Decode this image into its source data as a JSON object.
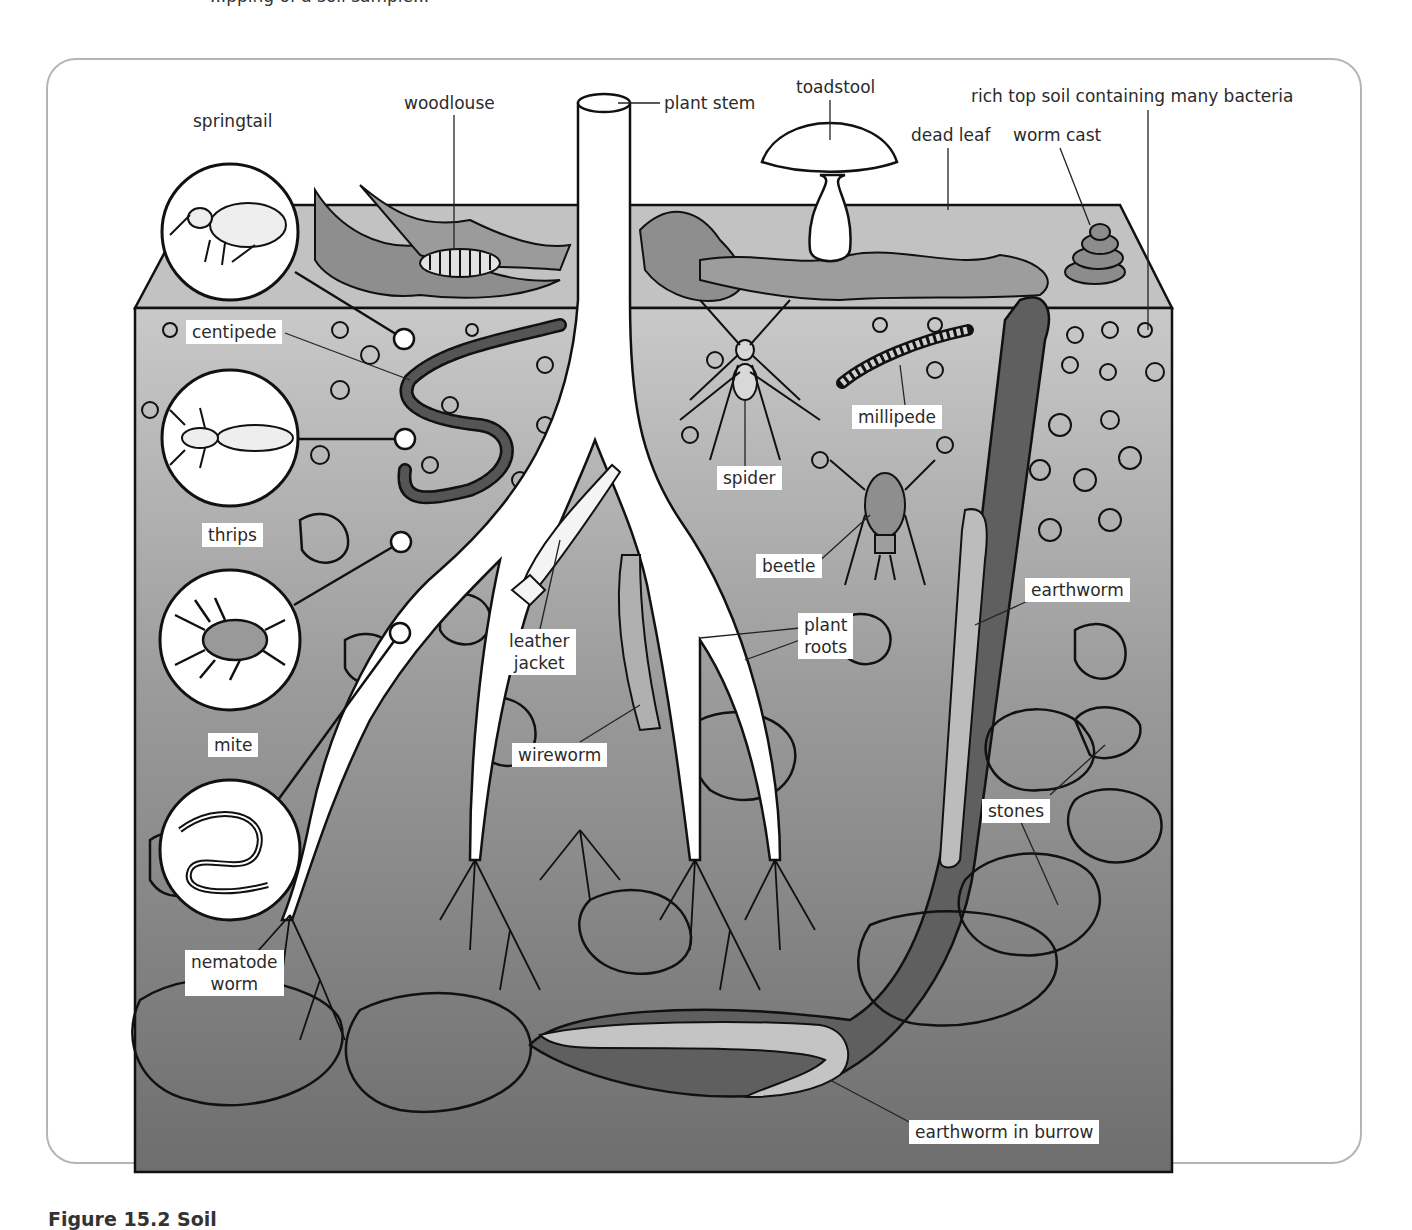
{
  "header": {
    "cut_text": "...pping of a soil sample..."
  },
  "figure": {
    "caption": "Figure 15.2 Soil",
    "colors": {
      "frame_border": "#b5b5b5",
      "soil_top": "#c6c6c6",
      "soil_bottom": "#707070",
      "litter_face": "#bdbdbd",
      "leaf": "#8a8a8a",
      "burrow": "#5e5e5e",
      "root": "#ffffff",
      "outline": "#111111",
      "label_bg": "#ffffff"
    },
    "labels": [
      {
        "id": "springtail",
        "text": "springtail",
        "x": 193,
        "y": 110,
        "boxed": false
      },
      {
        "id": "woodlouse",
        "text": "woodlouse",
        "x": 404,
        "y": 92,
        "boxed": false
      },
      {
        "id": "plant-stem",
        "text": "plant stem",
        "x": 664,
        "y": 92,
        "boxed": false
      },
      {
        "id": "toadstool",
        "text": "toadstool",
        "x": 796,
        "y": 76,
        "boxed": false
      },
      {
        "id": "dead-leaf",
        "text": "dead leaf",
        "x": 911,
        "y": 124,
        "boxed": false
      },
      {
        "id": "worm-cast",
        "text": "worm cast",
        "x": 1013,
        "y": 124,
        "boxed": false
      },
      {
        "id": "rich-top-soil",
        "text": "rich top soil containing many bacteria",
        "x": 971,
        "y": 85,
        "boxed": false
      },
      {
        "id": "centipede",
        "text": "centipede",
        "x": 186,
        "y": 320,
        "boxed": true
      },
      {
        "id": "thrips",
        "text": "thrips",
        "x": 202,
        "y": 523,
        "boxed": true
      },
      {
        "id": "mite",
        "text": "mite",
        "x": 208,
        "y": 733,
        "boxed": true
      },
      {
        "id": "nematode-worm",
        "text": "nematode\nworm",
        "x": 185,
        "y": 950,
        "boxed": true
      },
      {
        "id": "spider",
        "text": "spider",
        "x": 717,
        "y": 466,
        "boxed": true
      },
      {
        "id": "millipede",
        "text": "millipede",
        "x": 852,
        "y": 405,
        "boxed": true
      },
      {
        "id": "beetle",
        "text": "beetle",
        "x": 756,
        "y": 554,
        "boxed": true
      },
      {
        "id": "leather-jacket",
        "text": "leather\njacket",
        "x": 503,
        "y": 629,
        "boxed": true
      },
      {
        "id": "plant-roots",
        "text": "plant\nroots",
        "x": 798,
        "y": 613,
        "boxed": true
      },
      {
        "id": "wireworm",
        "text": "wireworm",
        "x": 512,
        "y": 743,
        "boxed": true
      },
      {
        "id": "earthworm",
        "text": "earthworm",
        "x": 1025,
        "y": 578,
        "boxed": true
      },
      {
        "id": "stones",
        "text": "stones",
        "x": 982,
        "y": 799,
        "boxed": true
      },
      {
        "id": "earthworm-in-burrow",
        "text": "earthworm in burrow",
        "x": 909,
        "y": 1120,
        "boxed": true
      }
    ],
    "magnifiers": [
      {
        "id": "springtail-magnifier",
        "cx": 230,
        "cy": 232,
        "r": 68,
        "marker_x": 404,
        "marker_y": 339,
        "marker_num": "1"
      },
      {
        "id": "thrips-magnifier",
        "cx": 230,
        "cy": 438,
        "r": 68,
        "marker_x": 405,
        "marker_y": 439,
        "marker_num": "1"
      },
      {
        "id": "mite-magnifier",
        "cx": 230,
        "cy": 640,
        "r": 70,
        "marker_x": 401,
        "marker_y": 542,
        "marker_num": "3"
      },
      {
        "id": "nematode-magnifier",
        "cx": 230,
        "cy": 850,
        "r": 70,
        "marker_x": 400,
        "marker_y": 633,
        "marker_num": "2"
      }
    ]
  }
}
